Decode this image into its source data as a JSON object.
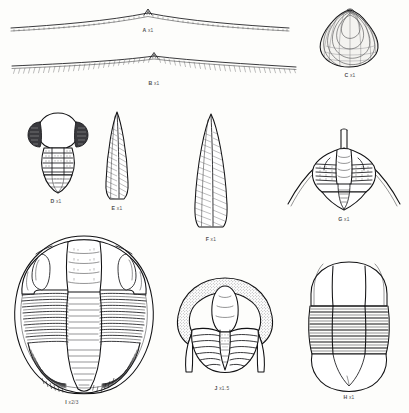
{
  "plate": {
    "kind": "palaeontological-figure-plate",
    "background_color": "#fdfdfb",
    "ink_color": "#17171a",
    "specimen_count": 10
  },
  "specimens": [
    {
      "letter": "A",
      "magnification": "x1",
      "caption": "A",
      "caption_mag": "x1",
      "description": "broad low-arched carapace margin in lateral view with fine denticulate fringe and small median apex"
    },
    {
      "letter": "B",
      "magnification": "x1",
      "caption": "B",
      "caption_mag": "x1",
      "description": "broad shallow carapace margin in lateral view with dense hatched fringe along lower edge and small median apex"
    },
    {
      "letter": "C",
      "magnification": "x1",
      "caption": "C",
      "caption_mag": "x1",
      "description": "ovate bivalve shell with concentric growth lines and pointed umbo"
    },
    {
      "letter": "D",
      "magnification": "x1",
      "caption": "D",
      "caption_mag": "x1",
      "description": "small trilobite with large smooth glabella, dark lateral cheek lobes, segmented thorax and triangular pygidium"
    },
    {
      "letter": "E",
      "magnification": "x1",
      "caption": "E",
      "caption_mag": "x1",
      "description": "elongate lanceolate spine with fine oblique hatching"
    },
    {
      "letter": "F",
      "magnification": "x1",
      "caption": "F",
      "caption_mag": "x1",
      "description": "broad lanceolate spine with fine oblique hatching"
    },
    {
      "letter": "G",
      "magnification": "x1",
      "caption": "G",
      "caption_mag": "x1",
      "description": "trilobite cephalon with long sweeping genal spines and posterior occipital spine"
    },
    {
      "letter": "H",
      "magnification": "x1",
      "caption": "H",
      "caption_mag": "x1",
      "description": "complete trilobite with broad cephalon, ten thoracic segments and large rounded pygidium"
    },
    {
      "letter": "I",
      "magnification": "x2/3",
      "caption": "I",
      "caption_mag": "x2/3",
      "description": "large complete trilobite, ovate outline, wide cephalon with eye lobes, many thoracic segments and fan-like pygidium"
    },
    {
      "letter": "J",
      "magnification": "x1.5",
      "caption": "J",
      "caption_mag": "x1.5",
      "description": "trilobite cephalon with stippled border, bulbous glabella, short genal spines and segmented pygidium"
    }
  ]
}
